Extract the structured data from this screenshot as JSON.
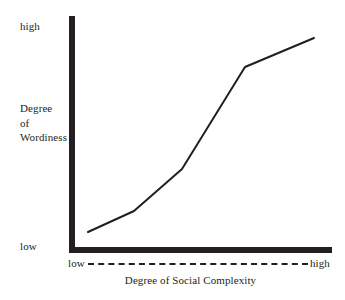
{
  "figure": {
    "background_color": "#ffffff",
    "ink_color": "#231f20"
  },
  "axes": {
    "y": {
      "title_line_1": "Degree",
      "title_line_2": "of",
      "title_line_3": "Wordiness",
      "high_tick_label": "high",
      "low_tick_label": "low"
    },
    "x": {
      "title": "Degree of Social Complexity",
      "low_tick_label": "low",
      "high_tick_label": "high"
    }
  },
  "chart_data": {
    "type": "line",
    "title": "",
    "subtitle": "",
    "xlabel": "Degree of Social Complexity",
    "ylabel": "Degree of Wordiness",
    "xlim": [
      0,
      100
    ],
    "ylim": [
      0,
      100
    ],
    "xtick_labels": [
      "low",
      "high"
    ],
    "ytick_labels": [
      "low",
      "high"
    ],
    "grid": false,
    "legend": false,
    "legend_position": "none",
    "annotations": [],
    "series": [
      {
        "name": "Wordiness vs Social Complexity",
        "color": "#231f20",
        "x": [
          7,
          25,
          43,
          67,
          93
        ],
        "y": [
          9,
          18,
          36,
          78,
          90
        ],
        "points_px": [
          [
            88,
            232
          ],
          [
            134,
            211
          ],
          [
            182,
            169
          ],
          [
            245,
            67
          ],
          [
            314,
            38
          ]
        ]
      }
    ]
  }
}
